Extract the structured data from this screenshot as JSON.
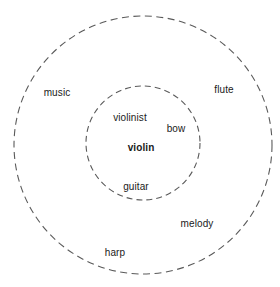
{
  "diagram": {
    "type": "concentric-circles",
    "title": "",
    "background_color": "#ffffff",
    "stroke_color": "#5a5a5a",
    "text_color": "#1a1a1a",
    "circles": [
      {
        "name": "outer-circle",
        "label": "",
        "cx": 143,
        "cy": 145,
        "r": 129,
        "style": "dashed"
      },
      {
        "name": "inner-circle",
        "label": "",
        "cx": 143,
        "cy": 143,
        "r": 57,
        "style": "dashed"
      }
    ],
    "labels": [
      {
        "id": "music",
        "text": "music",
        "x": 57,
        "y": 93,
        "emphasis": "normal",
        "region": "outer"
      },
      {
        "id": "flute",
        "text": "flute",
        "x": 224,
        "y": 90,
        "emphasis": "normal",
        "region": "outer"
      },
      {
        "id": "melody",
        "text": "melody",
        "x": 197,
        "y": 224,
        "emphasis": "normal",
        "region": "outer"
      },
      {
        "id": "harp",
        "text": "harp",
        "x": 115,
        "y": 253,
        "emphasis": "normal",
        "region": "outer"
      },
      {
        "id": "violinist",
        "text": "violinist",
        "x": 130,
        "y": 118,
        "emphasis": "normal",
        "region": "inner"
      },
      {
        "id": "bow",
        "text": "bow",
        "x": 176,
        "y": 129,
        "emphasis": "normal",
        "region": "inner"
      },
      {
        "id": "violin",
        "text": "violin",
        "x": 141,
        "y": 148,
        "emphasis": "bold",
        "region": "inner"
      },
      {
        "id": "guitar",
        "text": "guitar",
        "x": 136,
        "y": 187,
        "emphasis": "normal",
        "region": "boundary"
      }
    ]
  }
}
